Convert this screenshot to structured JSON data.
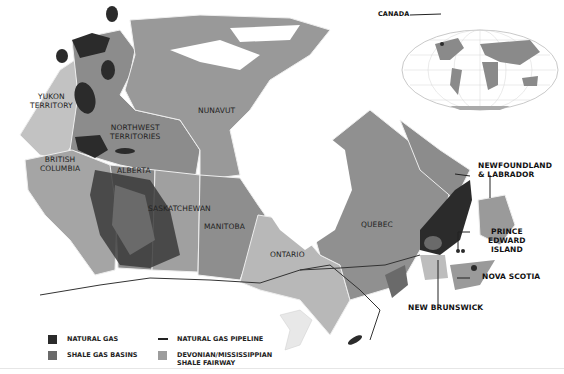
{
  "map": {
    "title_region": "Canada",
    "colors": {
      "natural_gas": "#2b2b2b",
      "shale_gas_basins": "#6a6a6a",
      "shale_fairway": "#9c9c9c",
      "province_dark": "#8a8a8a",
      "province_mid": "#a3a3a3",
      "province_light": "#bdbdbd",
      "water": "#ffffff",
      "pipeline": "#333333"
    },
    "labels": {
      "yukon": "YUKON\nTERRITORY",
      "yukon_1": "YUKON",
      "yukon_2": "TERRITORY",
      "nwt_1": "NORTHWEST",
      "nwt_2": "TERRITORIES",
      "nunavut": "NUNAVUT",
      "bc_1": "BRITISH",
      "bc_2": "COLUMBIA",
      "alberta": "ALBERTA",
      "saskatchewan": "SASKATCHEWAN",
      "manitoba": "MANITOBA",
      "ontario": "ONTARIO",
      "quebec": "QUEBEC",
      "nl_1": "NEWFOUNDLAND",
      "nl_2": "& LABRADOR",
      "pei_1": "PRINCE",
      "pei_2": "EDWARD",
      "pei_3": "ISLAND",
      "nova_scotia": "NOVA SCOTIA",
      "new_brunswick": "NEW BRUNSWICK"
    },
    "inset": {
      "label": "CANADA",
      "type": "world-map-inset"
    }
  },
  "legend": {
    "items": [
      {
        "label": "NATURAL GAS",
        "type": "swatch",
        "color": "#2b2b2b"
      },
      {
        "label": "SHALE GAS BASINS",
        "type": "swatch",
        "color": "#6a6a6a"
      },
      {
        "label": "NATURAL GAS PIPELINE",
        "type": "line",
        "color": "#222222"
      },
      {
        "label_1": "DEVONIAN/MISSISSIPPIAN",
        "label_2": "SHALE FAIRWAY",
        "type": "swatch",
        "color": "#9c9c9c"
      }
    ]
  }
}
